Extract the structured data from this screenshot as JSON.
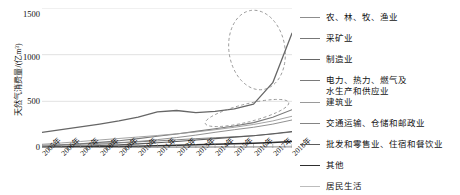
{
  "chart_data": {
    "type": "line",
    "title": "",
    "xlabel": "",
    "ylabel": "天然气消费量/(亿m³)",
    "ylim": [
      0,
      1500
    ],
    "yticks": [
      0,
      500,
      1000,
      1500
    ],
    "grid": true,
    "legend_position": "right",
    "categories": [
      "2005年",
      "2006年",
      "2007年",
      "2008年",
      "2009年",
      "2010年",
      "2011年",
      "2012年",
      "2013年",
      "2014年",
      "2015年",
      "2016年",
      "2017年",
      "2018年"
    ],
    "annotations": [
      {
        "name": "ellipse-manufacturing-surge",
        "shape": "dashed-ellipse",
        "note": "制造业 2016-2018 急升区"
      },
      {
        "name": "ellipse-transport-retail",
        "shape": "dashed-ellipse",
        "note": "交通运输与批发零售 2013-2018 区"
      }
    ],
    "series": [
      {
        "name": "农、林、牧、渔业",
        "color": "#8d8d8d",
        "width": 0.9,
        "values": [
          4,
          5,
          6,
          7,
          8,
          9,
          10,
          11,
          12,
          13,
          14,
          15,
          16,
          18
        ]
      },
      {
        "name": "采矿业",
        "color": "#777777",
        "width": 0.9,
        "values": [
          30,
          36,
          44,
          52,
          58,
          66,
          76,
          88,
          100,
          110,
          120,
          132,
          150,
          172
        ]
      },
      {
        "name": "制造业",
        "color": "#666666",
        "width": 1.3,
        "values": [
          168,
          196,
          226,
          256,
          290,
          330,
          386,
          402,
          380,
          392,
          420,
          470,
          700,
          1230
        ]
      },
      {
        "name": "电力、热力、燃气及\n水生产和供应业",
        "color": "#7a7a7a",
        "width": 1.1,
        "values": [
          18,
          30,
          44,
          60,
          78,
          100,
          126,
          150,
          178,
          206,
          236,
          272,
          330,
          410
        ]
      },
      {
        "name": "建筑业",
        "color": "#9a9a9a",
        "width": 0.9,
        "values": [
          40,
          54,
          70,
          86,
          102,
          118,
          134,
          152,
          172,
          196,
          222,
          252,
          290,
          340
        ]
      },
      {
        "name": "交通运输、仓储和邮政业",
        "color": "#848484",
        "width": 0.9,
        "values": [
          10,
          18,
          28,
          40,
          54,
          70,
          90,
          112,
          138,
          168,
          196,
          222,
          256,
          300
        ]
      },
      {
        "name": "批发和零售业、住宿和餐饮业",
        "color": "#5c5c5c",
        "width": 1.1,
        "values": [
          8,
          12,
          18,
          26,
          34,
          44,
          56,
          70,
          86,
          100,
          116,
          132,
          152,
          176
        ]
      },
      {
        "name": "其他",
        "color": "#2e2e2e",
        "width": 1.5,
        "values": [
          6,
          8,
          10,
          13,
          16,
          20,
          24,
          29,
          34,
          40,
          46,
          52,
          60,
          70
        ]
      },
      {
        "name": "居民生活",
        "color": "#bcbcbc",
        "width": 0.9,
        "values": [
          3,
          4,
          5,
          6,
          7,
          8,
          9,
          10,
          11,
          12,
          13,
          14,
          15,
          16
        ]
      }
    ]
  },
  "axis": {
    "ylabel_text": "天然气消费量/(亿m³)",
    "yticks": [
      "1500",
      "1000",
      "500",
      "0"
    ]
  },
  "legend": {
    "items": [
      {
        "label": "农、林、牧、渔业"
      },
      {
        "label": "采矿业"
      },
      {
        "label": "制造业"
      },
      {
        "label": "电力、热力、燃气及\n水生产和供应业"
      },
      {
        "label": "建筑业"
      },
      {
        "label": "交通运输、仓储和邮政业"
      },
      {
        "label": "批发和零售业、住宿和餐饮业"
      },
      {
        "label": "其他"
      },
      {
        "label": "居民生活"
      }
    ]
  }
}
